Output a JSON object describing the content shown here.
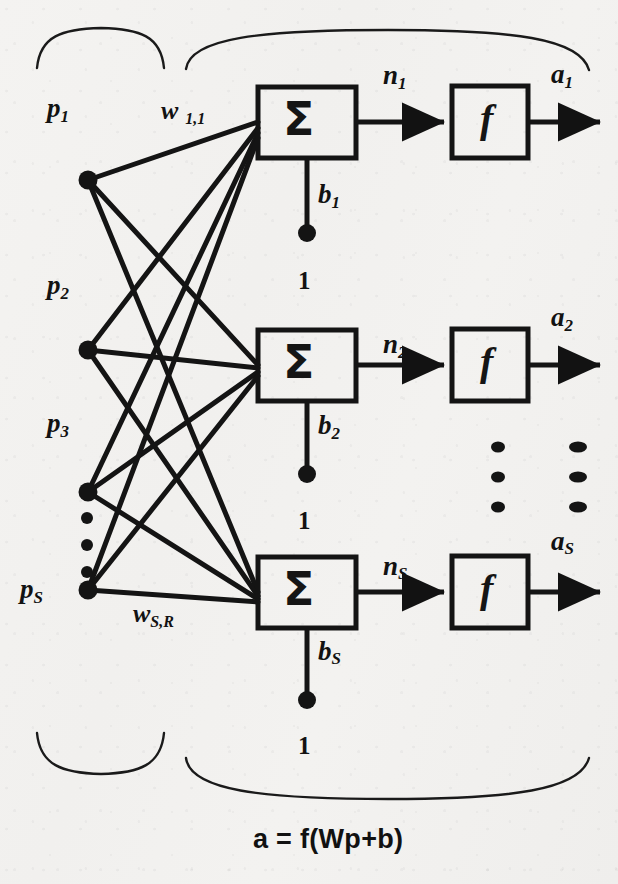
{
  "figure": {
    "kind": "neural-network-layer-diagram",
    "caption": "a = f(Wp+b)",
    "background_color": "#f2f1ef",
    "ink_color": "#111111"
  },
  "inputs": {
    "group_label": "Input",
    "nodes": [
      {
        "id": "p1",
        "base": "p",
        "sub": "1",
        "x": 88,
        "y": 180
      },
      {
        "id": "p2",
        "base": "p",
        "sub": "2",
        "x": 88,
        "y": 350
      },
      {
        "id": "p3",
        "base": "p",
        "sub": "3",
        "x": 88,
        "y": 492
      },
      {
        "id": "pS",
        "base": "p",
        "sub": "S",
        "x": 88,
        "y": 590
      }
    ],
    "vertical_ellipsis": {
      "x": 87,
      "dots_y": [
        518,
        545,
        572
      ]
    }
  },
  "weights": {
    "first_label": {
      "base": "w",
      "sub": "1,1"
    },
    "last_label": {
      "base": "w",
      "sub": "S,R"
    }
  },
  "neurons": [
    {
      "index": 1,
      "sum_symbol": "Σ",
      "net_label": {
        "base": "n",
        "sub": "1"
      },
      "transfer_symbol": "f",
      "output_label": {
        "base": "a",
        "sub": "1"
      },
      "bias_label": {
        "base": "b",
        "sub": "1"
      },
      "bias_input": "1"
    },
    {
      "index": 2,
      "sum_symbol": "Σ",
      "net_label": {
        "base": "n",
        "sub": "2"
      },
      "transfer_symbol": "f",
      "output_label": {
        "base": "a",
        "sub": "2"
      },
      "bias_label": {
        "base": "b",
        "sub": "2"
      },
      "bias_input": "1"
    },
    {
      "index": 3,
      "sum_symbol": "Σ",
      "net_label": {
        "base": "n",
        "sub": "S"
      },
      "transfer_symbol": "f",
      "output_label": {
        "base": "a",
        "sub": "S"
      },
      "bias_label": {
        "base": "b",
        "sub": "S"
      },
      "bias_input": "1"
    }
  ],
  "ellipses": {
    "neuron_column": {
      "x": 498,
      "dots_y": [
        447,
        477,
        507
      ]
    },
    "output_column": {
      "x": 578,
      "dots_y": [
        447,
        477,
        507
      ]
    }
  },
  "braces": {
    "top_left": "input-group-brace",
    "top_right": "layer-group-brace",
    "bottom_left": "input-group-brace",
    "bottom_right": "layer-group-brace"
  }
}
